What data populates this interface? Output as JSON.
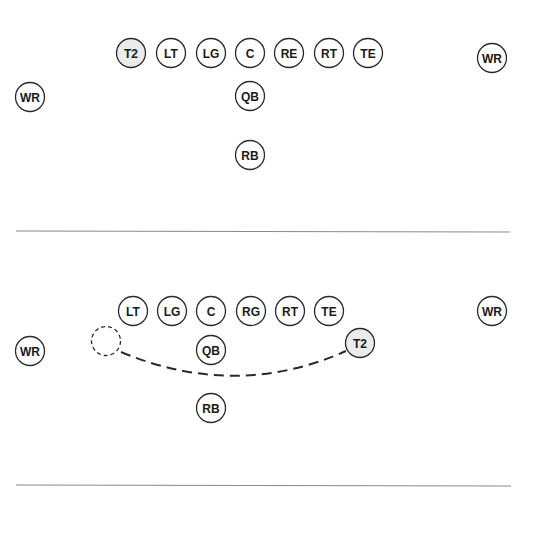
{
  "diagrams": [
    {
      "name": "formation-1",
      "players": [
        {
          "label": "T2",
          "x": 131,
          "y": 53,
          "highlight": true
        },
        {
          "label": "LT",
          "x": 171,
          "y": 53,
          "highlight": false
        },
        {
          "label": "LG",
          "x": 211,
          "y": 53,
          "highlight": false
        },
        {
          "label": "C",
          "x": 250,
          "y": 53,
          "highlight": false
        },
        {
          "label": "RE",
          "x": 289,
          "y": 53,
          "highlight": false
        },
        {
          "label": "RT",
          "x": 329,
          "y": 53,
          "highlight": false
        },
        {
          "label": "TE",
          "x": 368,
          "y": 53,
          "highlight": false
        },
        {
          "label": "WR",
          "x": 492,
          "y": 58,
          "highlight": false
        },
        {
          "label": "WR",
          "x": 30,
          "y": 97,
          "highlight": false
        },
        {
          "label": "QB",
          "x": 250,
          "y": 96,
          "highlight": false
        },
        {
          "label": "RB",
          "x": 250,
          "y": 155,
          "highlight": false
        }
      ],
      "divider_y": 231
    },
    {
      "name": "formation-2",
      "players": [
        {
          "label": "LT",
          "x": 133,
          "y": 311,
          "highlight": false
        },
        {
          "label": "LG",
          "x": 172,
          "y": 311,
          "highlight": false
        },
        {
          "label": "C",
          "x": 211,
          "y": 311,
          "highlight": false
        },
        {
          "label": "RG",
          "x": 251,
          "y": 311,
          "highlight": false
        },
        {
          "label": "RT",
          "x": 290,
          "y": 311,
          "highlight": false
        },
        {
          "label": "TE",
          "x": 329,
          "y": 311,
          "highlight": false
        },
        {
          "label": "WR",
          "x": 492,
          "y": 311,
          "highlight": false
        },
        {
          "label": "WR",
          "x": 30,
          "y": 351,
          "highlight": false
        },
        {
          "label": "QB",
          "x": 211,
          "y": 350,
          "highlight": false
        },
        {
          "label": "T2",
          "x": 360,
          "y": 343,
          "highlight": true
        },
        {
          "label": "RB",
          "x": 211,
          "y": 408,
          "highlight": false
        }
      ],
      "ghost_position": {
        "x": 106,
        "y": 341
      },
      "motion_path": {
        "from": [
          121,
          352
        ],
        "control": [
          236,
          400
        ],
        "to": [
          346,
          351
        ]
      },
      "divider_y": 485
    }
  ]
}
